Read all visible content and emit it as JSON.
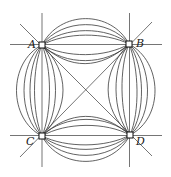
{
  "figure": {
    "points": [
      {
        "label": "A",
        "x": 42,
        "y": 45,
        "lx": 28,
        "ly": 48
      },
      {
        "label": "B",
        "x": 129,
        "y": 44,
        "lx": 136,
        "ly": 47
      },
      {
        "label": "C",
        "x": 42,
        "y": 136,
        "lx": 26,
        "ly": 145
      },
      {
        "label": "D",
        "x": 130,
        "y": 135,
        "lx": 136,
        "ly": 145
      }
    ],
    "colors": {
      "stroke": "#3a3a3a",
      "background": "#ffffff"
    }
  }
}
